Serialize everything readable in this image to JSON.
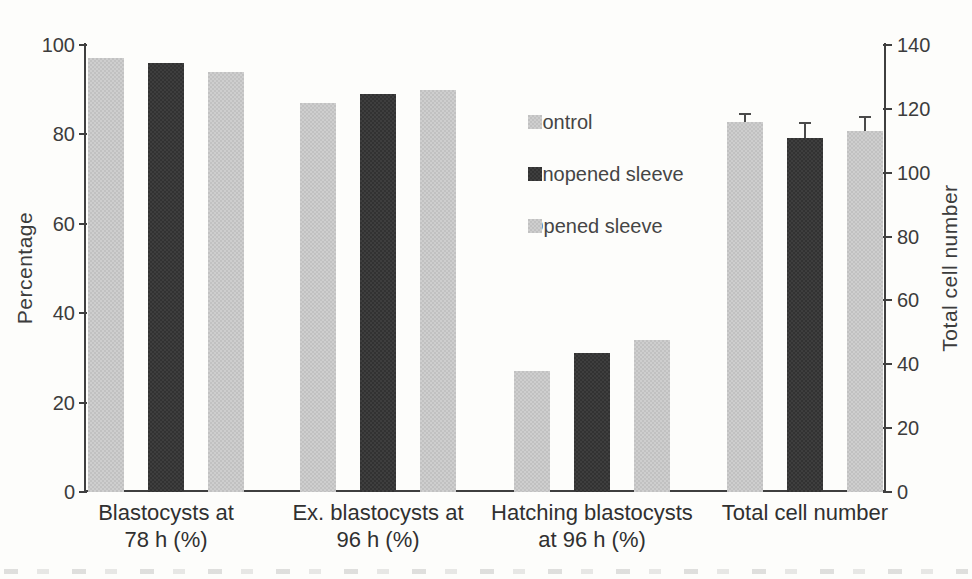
{
  "chart_data": {
    "type": "bar",
    "title": "",
    "categories": [
      "Blastocysts at 78 h (%)",
      "Ex. blastocysts at 96 h (%)",
      "Hatching blastocysts at 96 h (%)",
      "Total cell number"
    ],
    "category_label_lines": [
      [
        "Blastocysts at",
        "78 h (%)"
      ],
      [
        "Ex. blastocysts at",
        "96 h (%)"
      ],
      [
        "Hatching blastocysts",
        "at 96 h (%)"
      ],
      [
        "Total cell number"
      ]
    ],
    "category_axis": [
      "left",
      "left",
      "left",
      "right"
    ],
    "series": [
      {
        "name": "Control",
        "color": "#c8c8c8",
        "shade": "light",
        "values": [
          97,
          87,
          27,
          116
        ],
        "errors": [
          null,
          null,
          null,
          2.5
        ]
      },
      {
        "name": "Unopened sleeve",
        "color": "#383838",
        "shade": "dark",
        "values": [
          96,
          89,
          31,
          111
        ],
        "errors": [
          null,
          null,
          null,
          4.5
        ]
      },
      {
        "name": "Opened sleeve",
        "color": "#c8c8c8",
        "shade": "light",
        "values": [
          94,
          90,
          34,
          113
        ],
        "errors": [
          null,
          null,
          null,
          4.5
        ]
      }
    ],
    "left_axis": {
      "label": "Percentage",
      "range": [
        0,
        100
      ],
      "ticks": [
        0,
        20,
        40,
        60,
        80,
        100
      ]
    },
    "right_axis": {
      "label": "Total cell number",
      "range": [
        0,
        140
      ],
      "ticks": [
        0,
        20,
        40,
        60,
        80,
        100,
        120,
        140
      ]
    },
    "legend": {
      "position": "inside-center",
      "entries": [
        {
          "label": "Control",
          "color": "#c8c8c8",
          "shade": "light"
        },
        {
          "label": "Unopened sleeve",
          "color": "#383838",
          "shade": "dark"
        },
        {
          "label": "Opened sleeve",
          "color": "#c8c8c8",
          "shade": "light"
        }
      ]
    },
    "error_bars": {
      "direction": "plus-only",
      "categories_with_errors": [
        "Total cell number"
      ]
    },
    "grid": false
  }
}
